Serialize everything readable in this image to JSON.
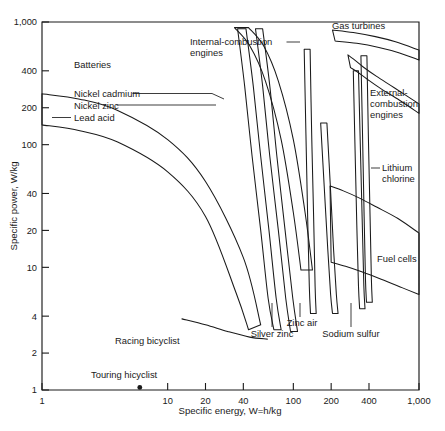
{
  "chart_data": {
    "type": "line",
    "title": "",
    "xlabel": "Specific energy, W=h/kg",
    "ylabel": "Specific power, W/kg",
    "xscale": "log",
    "yscale": "log",
    "xlim": [
      1,
      1000
    ],
    "ylim": [
      1,
      1000
    ],
    "grid": false,
    "legend": "none",
    "x_ticks": [
      "1",
      "10",
      "20",
      "40",
      "100",
      "200",
      "400",
      "1,000"
    ],
    "x_tick_values": [
      1,
      10,
      20,
      40,
      100,
      200,
      400,
      1000
    ],
    "y_ticks": [
      "1",
      "2",
      "4",
      "10",
      "20",
      "40",
      "100",
      "200",
      "400",
      "1,000"
    ],
    "y_tick_values": [
      1,
      2,
      4,
      10,
      20,
      40,
      100,
      200,
      400,
      1000
    ],
    "annotations": [
      "Batteries",
      "Nickel cadmium",
      "Nickel zinc",
      "Lead acid",
      "Internal-combustion engines",
      "Gas turbines",
      "External-combustion engines",
      "Lithium chlorine",
      "Fuel cells",
      "Zinc air",
      "Silver zinc",
      "Sodium sulfur",
      "Racing bicyclist",
      "Touring bicyclist"
    ],
    "series": [
      {
        "name": "Lead acid",
        "kind": "band",
        "upper_x": [
          1,
          2,
          4,
          10,
          20,
          40,
          55
        ],
        "upper_y": [
          260,
          235,
          190,
          110,
          50,
          12,
          3.4
        ],
        "lower_x": [
          1,
          2,
          4,
          10,
          20,
          35,
          44
        ],
        "lower_y": [
          145,
          130,
          105,
          60,
          26,
          6.2,
          3.1
        ]
      },
      {
        "name": "Nickel zinc",
        "kind": "band",
        "upper_x": [
          36,
          41,
          47,
          55,
          63,
          70
        ],
        "upper_y": [
          880,
          300,
          80,
          20,
          5.6,
          3.1
        ],
        "lower_x": [
          42,
          48,
          55,
          64,
          73,
          80
        ],
        "lower_y": [
          880,
          300,
          80,
          20,
          5.6,
          3.1
        ]
      },
      {
        "name": "Nickel cadmium",
        "kind": "band",
        "upper_x": [
          50,
          57,
          65,
          76,
          87,
          95
        ],
        "upper_y": [
          880,
          300,
          80,
          20,
          5.6,
          3.0
        ],
        "lower_x": [
          57,
          65,
          74,
          86,
          99,
          108
        ],
        "lower_y": [
          880,
          300,
          80,
          20,
          5.6,
          3.0
        ]
      },
      {
        "name": "Silver zinc",
        "kind": "band",
        "upper_x": [
          122,
          126,
          130,
          134,
          137
        ],
        "upper_y": [
          600,
          120,
          26,
          7.0,
          4.2
        ],
        "lower_x": [
          136,
          140,
          145,
          149,
          152
        ],
        "lower_y": [
          600,
          120,
          26,
          7.0,
          4.2
        ]
      },
      {
        "name": "Zinc air",
        "kind": "band",
        "upper_x": [
          165,
          176,
          188,
          198,
          205
        ],
        "upper_y": [
          150,
          46,
          14,
          6.0,
          4.2
        ],
        "lower_x": [
          185,
          197,
          209,
          220,
          227
        ],
        "lower_y": [
          150,
          46,
          14,
          6.0,
          4.2
        ]
      },
      {
        "name": "Sodium sulfur",
        "kind": "band",
        "upper_x": [
          300,
          310,
          320,
          330,
          337
        ],
        "upper_y": [
          400,
          90,
          22,
          7.0,
          4.6
        ],
        "lower_x": [
          330,
          342,
          354,
          364,
          372
        ],
        "lower_y": [
          400,
          90,
          22,
          7.0,
          4.6
        ]
      },
      {
        "name": "Lithium chlorine",
        "kind": "band",
        "upper_x": [
          345,
          356,
          366,
          375,
          382
        ],
        "upper_y": [
          530,
          110,
          26,
          8.0,
          5.2
        ],
        "lower_x": [
          385,
          396,
          408,
          418,
          425
        ],
        "lower_y": [
          530,
          110,
          26,
          8.0,
          5.2
        ]
      },
      {
        "name": "Internal-combustion engines",
        "kind": "band",
        "upper_x": [
          34,
          45,
          60,
          80,
          100,
          115
        ],
        "upper_y": [
          900,
          640,
          330,
          110,
          28,
          9.5
        ],
        "lower_x": [
          44,
          58,
          76,
          100,
          124,
          142
        ],
        "lower_y": [
          900,
          640,
          330,
          110,
          28,
          9.5
        ]
      },
      {
        "name": "Gas turbines",
        "kind": "band",
        "upper_x": [
          205,
          300,
          450,
          650,
          1000
        ],
        "upper_y": [
          860,
          820,
          760,
          690,
          590
        ],
        "lower_x": [
          215,
          320,
          480,
          700,
          1000
        ],
        "lower_y": [
          700,
          670,
          620,
          560,
          490
        ]
      },
      {
        "name": "External-combustion engines",
        "kind": "band",
        "upper_x": [
          272,
          300,
          360,
          460,
          640,
          1000
        ],
        "upper_y": [
          540,
          500,
          430,
          360,
          290,
          215
        ],
        "lower_x": [
          285,
          320,
          390,
          500,
          700,
          1000
        ],
        "lower_y": [
          425,
          395,
          340,
          285,
          230,
          180
        ]
      },
      {
        "name": "Fuel cells",
        "kind": "band",
        "upper_x": [
          196,
          250,
          330,
          460,
          680,
          1000
        ],
        "upper_y": [
          46,
          42,
          37,
          31,
          25,
          19
        ],
        "lower_x": [
          200,
          260,
          350,
          500,
          740,
          1000
        ],
        "lower_y": [
          11,
          10.2,
          9.2,
          8.0,
          6.8,
          6.0
        ]
      },
      {
        "name": "Racing bicyclist",
        "kind": "curve",
        "x": [
          13,
          20,
          30,
          45,
          62
        ],
        "y": [
          3.8,
          3.4,
          3.0,
          2.7,
          2.6
        ]
      },
      {
        "name": "Touring bicyclist",
        "kind": "point",
        "x": [
          6.0
        ],
        "y": [
          1.05
        ]
      }
    ]
  },
  "labels": {
    "batteries": "Batteries",
    "nickel_cadmium": "Nickel cadmium",
    "nickel_zinc": "Nickel zinc",
    "lead_acid": "Lead acid",
    "ic_engines_line1": "Internal-combustion",
    "ic_engines_line2": "engines",
    "gas_turbines": "Gas turbines",
    "ext_comb_line1": "External-",
    "ext_comb_line2": "combustion",
    "ext_comb_line3": "engines",
    "lithium_line1": "Lithium",
    "lithium_line2": "chlorine",
    "fuel_cells": "Fuel cells",
    "zinc_air": "Zinc air",
    "silver_zinc": "Silver zinc",
    "sodium_sulfur": "Sodium sulfur",
    "racing_bicyclist": "Racing bicyclist",
    "touring_bicyclist": "Touring hicyclist"
  },
  "axes": {
    "x_title": "Specific energy, W=h/kg",
    "y_title": "Specific power, W/kg",
    "x_ticks": [
      "1",
      "10",
      "20",
      "40",
      "100",
      "200",
      "400",
      "1,000"
    ],
    "y_ticks": [
      "1",
      "2",
      "4",
      "10",
      "20",
      "40",
      "100",
      "200",
      "400",
      "1,000"
    ]
  },
  "colors": {
    "ink": "#1a1a1a",
    "background": "#ffffff"
  }
}
